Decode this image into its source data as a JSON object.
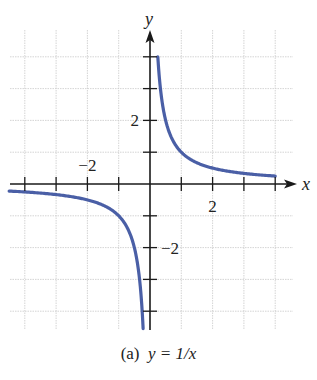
{
  "chart_data": {
    "type": "line",
    "title": "",
    "caption_prefix": "(a)",
    "caption_equation": "y = 1/x",
    "xlabel": "x",
    "ylabel": "y",
    "xlim": [
      -4.5,
      4.6
    ],
    "ylim": [
      -4.5,
      5
    ],
    "xticks": [
      -4,
      -3,
      -2,
      -1,
      1,
      2,
      3,
      4
    ],
    "yticks": [
      -4,
      -3,
      -2,
      -1,
      1,
      2,
      3,
      4
    ],
    "xtick_labels": [
      {
        "value": -2,
        "label": "−2"
      },
      {
        "value": 2,
        "label": "2"
      }
    ],
    "ytick_labels": [
      {
        "value": 2,
        "label": "2"
      },
      {
        "value": -2,
        "label": "−2"
      }
    ],
    "grid": true,
    "series": [
      {
        "name": "y = 1/x (x > 0)",
        "color": "#4a5fa6",
        "x": [
          0.25,
          0.3,
          0.4,
          0.5,
          0.75,
          1,
          1.5,
          2,
          2.5,
          3,
          3.5,
          4
        ],
        "y": [
          4,
          3.33,
          2.5,
          2,
          1.33,
          1,
          0.67,
          0.5,
          0.4,
          0.33,
          0.29,
          0.25
        ]
      },
      {
        "name": "y = 1/x (x < 0)",
        "color": "#4a5fa6",
        "x": [
          -4.5,
          -4,
          -3.5,
          -3,
          -2.5,
          -2,
          -1.5,
          -1,
          -0.75,
          -0.5,
          -0.4,
          -0.3,
          -0.25,
          -0.22
        ],
        "y": [
          -0.22,
          -0.25,
          -0.29,
          -0.33,
          -0.4,
          -0.5,
          -0.67,
          -1,
          -1.33,
          -2,
          -2.5,
          -3.33,
          -4,
          -4.5
        ]
      }
    ]
  },
  "labels": {
    "x_axis": "x",
    "y_axis": "y",
    "caption_prefix": "(a)",
    "caption_equation": "y = 1/x"
  }
}
